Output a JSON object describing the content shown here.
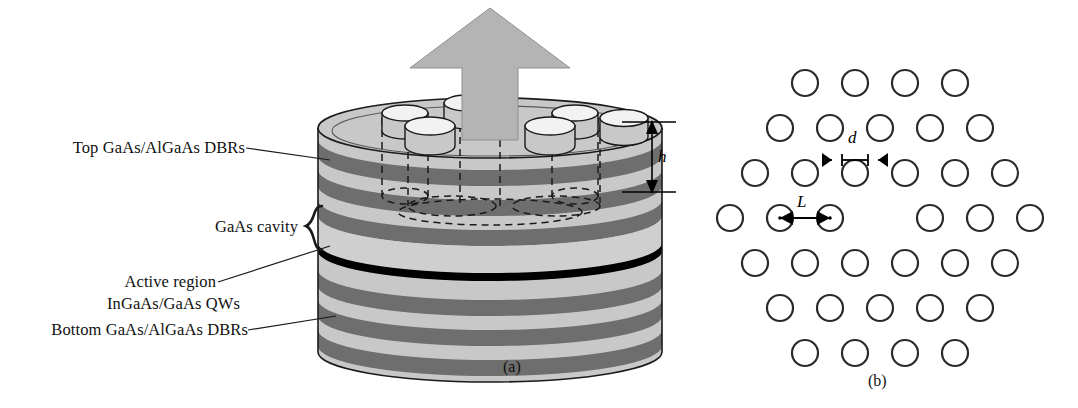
{
  "figure": {
    "type": "schematic-diagram",
    "panels": [
      {
        "id": "a",
        "caption": "(a)",
        "view": "3D cross-section of pillar"
      },
      {
        "id": "b",
        "caption": "(b)",
        "view": "top view of hexagonal hole lattice"
      }
    ]
  },
  "panel_a": {
    "labels": {
      "top_dbr": "Top GaAs/AlGaAs DBRs",
      "cavity": "GaAs cavity",
      "active_line1": "Active region",
      "active_line2": "InGaAs/GaAs QWs",
      "bottom_dbr": "Bottom GaAs/AlGaAs DBRs"
    },
    "dimensions": {
      "etch_depth": "h"
    },
    "emission_arrow": "upward laser emission",
    "hole_count_top": 6
  },
  "panel_b": {
    "dimensions": {
      "hole_diameter": "d",
      "lattice_pitch": "L"
    },
    "lattice": {
      "type": "hexagonal",
      "rows": [
        4,
        5,
        6,
        7,
        6,
        5,
        4
      ],
      "total_holes": 36,
      "central_defect": true,
      "defect_description": "missing hole at lattice center"
    }
  },
  "colors": {
    "dbr_dark": "#6e6e6e",
    "layer_light": "#c8c8c8",
    "cavity_light": "#cfcfcf",
    "arrow_gray": "#b4b4b4",
    "active_black": "#000000",
    "stroke": "#1a1a1a"
  }
}
